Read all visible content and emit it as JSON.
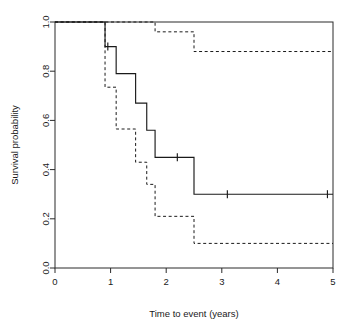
{
  "figure": {
    "name": "kaplan-meier-survival-plot",
    "background_color": "#ffffff",
    "line_color": "#1a1a1a"
  },
  "chart_data": {
    "type": "line",
    "title": "",
    "subtitle": "",
    "xlabel": "Time to event (years)",
    "ylabel": "Survival probability",
    "xlim": [
      0,
      5
    ],
    "ylim": [
      0,
      1
    ],
    "xticks": [
      0,
      1,
      2,
      3,
      4,
      5
    ],
    "xtick_labels": [
      "0",
      "1",
      "2",
      "3",
      "4",
      "5"
    ],
    "yticks": [
      0.0,
      0.2,
      0.4,
      0.6,
      0.8,
      1.0
    ],
    "ytick_labels": [
      "0.0",
      "0.2",
      "0.4",
      "0.6",
      "0.8",
      "1.0"
    ],
    "grid": false,
    "legend": null,
    "legend_position": "none",
    "step_type": "post",
    "series": [
      {
        "name": "Kaplan-Meier estimate",
        "style": "solid",
        "x": [
          0.0,
          0.9,
          1.1,
          1.45,
          1.65,
          1.8,
          2.5,
          5.0
        ],
        "values": [
          1.0,
          0.9,
          0.79,
          0.67,
          0.56,
          0.45,
          0.3,
          0.3
        ]
      },
      {
        "name": "Upper 95% confidence limit",
        "style": "dashed",
        "x": [
          0.0,
          1.8,
          2.5,
          5.0
        ],
        "values": [
          1.0,
          0.96,
          0.88,
          0.88
        ]
      },
      {
        "name": "Lower 95% confidence limit",
        "style": "dashed",
        "x": [
          0.0,
          0.9,
          1.1,
          1.45,
          1.65,
          1.8,
          2.5,
          5.0
        ],
        "values": [
          1.0,
          0.735,
          0.565,
          0.43,
          0.34,
          0.21,
          0.1,
          0.1
        ]
      }
    ],
    "censor_marks": [
      {
        "x": 0.95,
        "y": 0.9
      },
      {
        "x": 2.2,
        "y": 0.45
      },
      {
        "x": 3.1,
        "y": 0.3
      },
      {
        "x": 4.9,
        "y": 0.3
      }
    ]
  }
}
